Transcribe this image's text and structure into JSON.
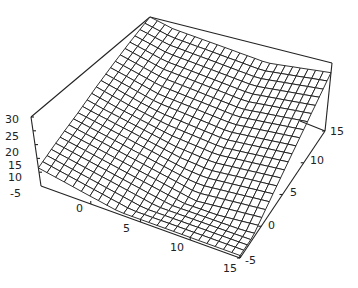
{
  "chart_data": {
    "type": "surface3d",
    "title": "",
    "x_axis": {
      "label": "",
      "range": [
        -5,
        15
      ],
      "ticks": [
        0,
        5,
        10,
        15
      ],
      "tick_labels": [
        "0",
        "5",
        "10",
        "15"
      ],
      "start_label": "-5"
    },
    "y_axis": {
      "label": "",
      "range": [
        -5,
        15
      ],
      "ticks": [
        -5,
        0,
        5,
        10,
        15
      ],
      "tick_labels": [
        "-5",
        "0",
        "5",
        "10",
        "15"
      ]
    },
    "z_axis": {
      "label": "",
      "range": [
        5,
        30
      ],
      "ticks": [
        10,
        15,
        20,
        25,
        30
      ],
      "tick_labels": [
        "10",
        "15",
        "20",
        "25",
        "30"
      ]
    },
    "mesh_resolution": 24,
    "surface_samples": {
      "corner_x-5_y-5": 21,
      "corner_x-5_y15": 30,
      "corner_x15_y15": 30,
      "corner_x15_y-5": 12,
      "minimum_region": "valley near x 5..15, y -5..0, z ~6"
    },
    "grid": false,
    "legend": null
  },
  "labels": {
    "x_start": "-5",
    "x_ticks": [
      "0",
      "5",
      "10",
      "15"
    ],
    "y_ticks": [
      "-5",
      "0",
      "5",
      "10",
      "15"
    ],
    "z_ticks": [
      "30",
      "25",
      "20",
      "15",
      "10"
    ]
  },
  "colors": {
    "line": "#1a1a1a",
    "background": "#ffffff"
  }
}
